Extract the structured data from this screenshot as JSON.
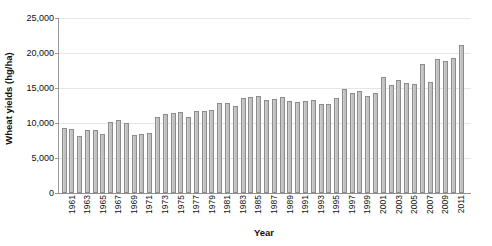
{
  "chart_data": {
    "type": "bar",
    "title": "",
    "xlabel": "Year",
    "ylabel": "Wheat yields (hg/ha)",
    "ylim": [
      0,
      25000
    ],
    "ytick_labels": [
      "0",
      "5,000",
      "10,000",
      "15,000",
      "20,000",
      "25,000"
    ],
    "ytick_values": [
      0,
      5000,
      10000,
      15000,
      20000,
      25000
    ],
    "grid": true,
    "legend": "none",
    "categories": [
      "1961",
      "1962",
      "1963",
      "1964",
      "1965",
      "1966",
      "1967",
      "1968",
      "1969",
      "1970",
      "1971",
      "1972",
      "1973",
      "1974",
      "1975",
      "1976",
      "1977",
      "1978",
      "1979",
      "1980",
      "1981",
      "1982",
      "1983",
      "1984",
      "1985",
      "1986",
      "1987",
      "1988",
      "1989",
      "1990",
      "1991",
      "1992",
      "1993",
      "1994",
      "1995",
      "1996",
      "1997",
      "1998",
      "1999",
      "2000",
      "2001",
      "2002",
      "2003",
      "2004",
      "2005",
      "2006",
      "2007",
      "2008",
      "2009",
      "2010",
      "2011",
      "2012"
    ],
    "xtick_labels": [
      "1961",
      "1963",
      "1965",
      "1967",
      "1969",
      "1971",
      "1973",
      "1975",
      "1977",
      "1979",
      "1981",
      "1983",
      "1985",
      "1987",
      "1989",
      "1991",
      "1993",
      "1995",
      "1997",
      "1999",
      "2001",
      "2003",
      "2005",
      "2007",
      "2009",
      "2011"
    ],
    "values": [
      9350,
      9150,
      8200,
      9000,
      9050,
      8450,
      10100,
      10400,
      9950,
      8350,
      8500,
      8600,
      10800,
      11300,
      11400,
      11550,
      10900,
      11700,
      11750,
      11900,
      12800,
      12900,
      12400,
      13600,
      13700,
      13800,
      13350,
      13400,
      13750,
      13100,
      13000,
      13150,
      13350,
      12650,
      12750,
      13550,
      14900,
      14300,
      14600,
      13900,
      14350,
      16600,
      15400,
      16100,
      15700,
      15600,
      18500,
      15800,
      19100,
      18900,
      19250,
      21100
    ],
    "bar_color": "#c6c6c6",
    "bar_border_color": "#8d8d8d",
    "axis_color": "#9a9a9a",
    "grid_color": "#e6e6e6",
    "background": "#ffffff"
  }
}
